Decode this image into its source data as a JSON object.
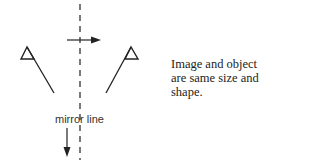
{
  "diagram": {
    "mirror_label": "mirror line",
    "caption_lines": [
      "Image and object",
      "are same size and",
      "shape."
    ],
    "elements": {
      "object": "flag (left of mirror line)",
      "image": "flag (right of mirror line, reflected)",
      "mirror_line": "dashed vertical line",
      "arrows": [
        "arrow pointing right toward mirror line",
        "arrow pointing down along mirror line"
      ]
    },
    "colors": {
      "stroke": "#222222",
      "text": "#333333",
      "background": "#ffffff"
    }
  }
}
